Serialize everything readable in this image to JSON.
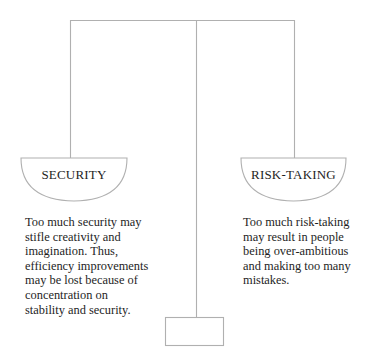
{
  "diagram": {
    "type": "balance-scale",
    "line_color": "#b0b0b0",
    "text_color": "#1e1e1e",
    "left_pan": {
      "label": "SECURITY",
      "description_lines": [
        "Too much security may",
        "stifle creativity and",
        "imagination. Thus,",
        "efficiency improvements",
        "may be lost because of",
        "concentration on",
        "stability and security."
      ]
    },
    "right_pan": {
      "label": "RISK-TAKING",
      "description_lines": [
        "Too much risk-taking",
        "may result in people",
        "being over-ambitious",
        "and making too many",
        "mistakes."
      ]
    }
  }
}
